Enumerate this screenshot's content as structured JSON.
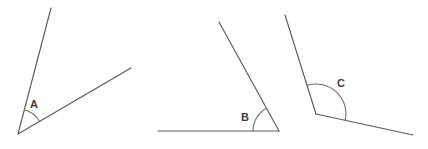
{
  "figure": {
    "background_color": "#ffffff",
    "line_color": "#5a5a5a",
    "arc_color": "#6a6a6a",
    "label_color": "#3d3d3d",
    "width": 428,
    "height": 149
  },
  "angles": [
    {
      "label": "A",
      "type": "acute",
      "vertex": {
        "x": 18,
        "y": 134
      },
      "label_pos": {
        "x": 34,
        "y": 105
      },
      "arc_radius": 25,
      "rays": [
        {
          "name": "ray-a-upper",
          "to": {
            "x": 51,
            "y": 8
          }
        },
        {
          "name": "ray-a-lower",
          "to": {
            "x": 131,
            "y": 68
          }
        }
      ]
    },
    {
      "label": "B",
      "type": "acute",
      "vertex": {
        "x": 279,
        "y": 131
      },
      "label_pos": {
        "x": 245,
        "y": 118
      },
      "arc_radius": 26,
      "rays": [
        {
          "name": "ray-b-horizontal",
          "to": {
            "x": 158,
            "y": 131
          }
        },
        {
          "name": "ray-b-upper",
          "to": {
            "x": 219,
            "y": 22
          }
        }
      ]
    },
    {
      "label": "C",
      "type": "obtuse",
      "vertex": {
        "x": 316,
        "y": 114
      },
      "label_pos": {
        "x": 341,
        "y": 84
      },
      "arc_radius": 30,
      "rays": [
        {
          "name": "ray-c-upper",
          "to": {
            "x": 285,
            "y": 15
          }
        },
        {
          "name": "ray-c-lower",
          "to": {
            "x": 413,
            "y": 135
          }
        }
      ]
    }
  ]
}
